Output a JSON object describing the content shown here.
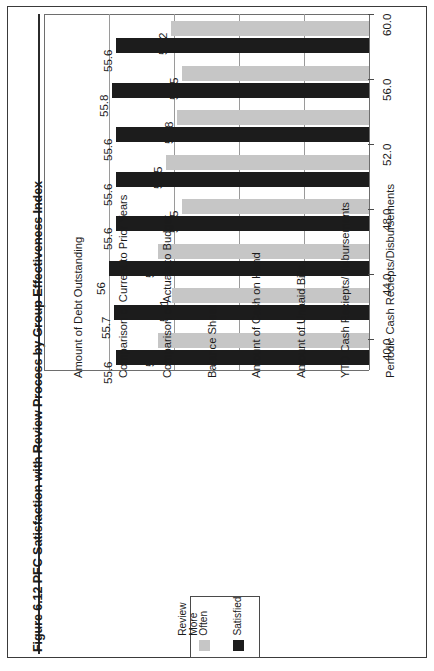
{
  "figure": {
    "title": "Figure 6.12 PFC Satisfaction with Review Process by Group Effectiveness Index"
  },
  "legend": {
    "entries": [
      {
        "label": "Review\nMore\nOften",
        "color": "#c6c6c6",
        "name": "review-more-often"
      },
      {
        "label": "Satisfied",
        "color": "#1c1c1c",
        "name": "satisfied"
      }
    ]
  },
  "axis": {
    "tick_labels": [
      "40.0",
      "44.0",
      "48.0",
      "52.0",
      "56.0",
      "60.0"
    ]
  },
  "chart_data": {
    "type": "bar",
    "orientation": "horizontal",
    "title": "Figure 6.12 PFC Satisfaction with Review Process by Group Effectiveness Index",
    "xlabel": "",
    "ylabel": "",
    "grid": true,
    "legend_position": "bottom-center",
    "axis_ticks": [
      40.0,
      44.0,
      48.0,
      52.0,
      56.0,
      60.0
    ],
    "ylim": [
      40.0,
      60.0
    ],
    "categories": [
      "Amount of Debt Outstanding",
      "Comparison of Current to Prior Years",
      "Comparison of Actuals to Budget",
      "Balance Sheet",
      "Amount of Cash on Hand",
      "Amount of Unpaid Bills",
      "YTD Cash Reciepts/Disbursements",
      "Periodic Cash Reciepts/Disbursements"
    ],
    "series": [
      {
        "name": "Review More Often",
        "color": "#c6c6c6",
        "values": [
          52.2,
          51.5,
          51.8,
          52.5,
          51.5,
          53,
          52.1,
          53
        ],
        "labels": [
          "52.2",
          "51.5",
          "51.8",
          "52.5",
          "51.5",
          "53",
          "52.1",
          "53"
        ]
      },
      {
        "name": "Satisfied",
        "color": "#1c1c1c",
        "values": [
          55.6,
          55.8,
          55.6,
          55.6,
          55.6,
          56,
          55.7,
          55.6
        ],
        "labels": [
          "55.6",
          "55.8",
          "55.6",
          "55.6",
          "55.6",
          "56",
          "55.7",
          "55.6"
        ]
      }
    ]
  }
}
